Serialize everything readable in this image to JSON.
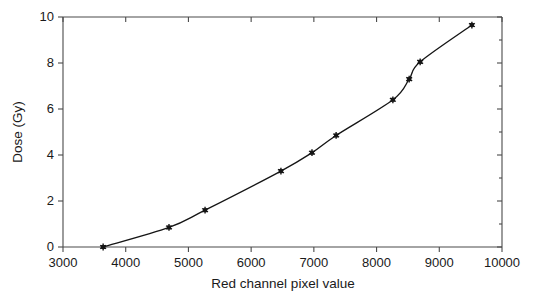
{
  "figure": {
    "background_color": "#ffffff",
    "axis_color": "#4a4a4a",
    "series_color": "#151515"
  },
  "chart_data": {
    "type": "line",
    "title": "",
    "subtitle": "",
    "xlabel": "Red channel pixel value",
    "ylabel": "Dose (Gy)",
    "xlim": [
      3000,
      10000
    ],
    "ylim": [
      0,
      10
    ],
    "xticks": [
      3000,
      4000,
      5000,
      6000,
      7000,
      8000,
      9000,
      10000
    ],
    "xtick_labels": [
      "3000",
      "4000",
      "5000",
      "6000",
      "7000",
      "8000",
      "9000",
      "10000"
    ],
    "yticks": [
      0,
      2,
      4,
      6,
      8,
      10
    ],
    "ytick_labels": [
      "0",
      "2",
      "4",
      "6",
      "8",
      "10"
    ],
    "grid": false,
    "legend": null,
    "marker": "star-asterisk",
    "frame": "box",
    "series": [
      {
        "name": "Calibration curve",
        "x": [
          3640,
          4690,
          5265,
          6475,
          6970,
          7355,
          8260,
          8520,
          8695,
          9520
        ],
        "y": [
          0.0,
          0.85,
          1.6,
          3.3,
          4.1,
          4.85,
          6.4,
          7.3,
          8.05,
          9.65
        ]
      }
    ],
    "annotations": []
  }
}
